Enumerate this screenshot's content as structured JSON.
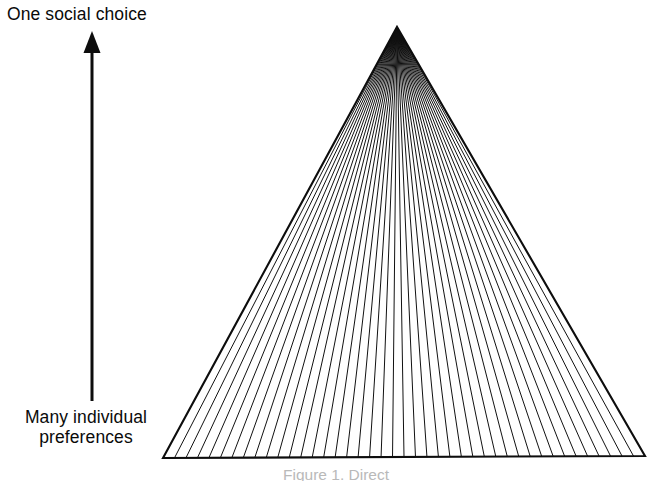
{
  "figure": {
    "background_color": "#ffffff",
    "ink_color": "#000000",
    "top_label": "One social choice",
    "bottom_label_line1": "Many individual",
    "bottom_label_line2": "preferences",
    "caption": "Figure 1.  Direct",
    "arrow": {
      "name": "upward-arrow",
      "direction": "up",
      "x": 92,
      "tail_y": 401,
      "head_y": 31,
      "shaft_width": 3,
      "head_width": 17,
      "head_height": 22
    },
    "triangle": {
      "apex_x": 397,
      "apex_y": 27,
      "base_left_x": 163,
      "base_left_y": 458,
      "base_right_x": 645,
      "base_right_y": 456,
      "outline_width": 2.1,
      "ray_count": 41,
      "ray_width": 1.0
    }
  },
  "chart_data": {
    "type": "diagram",
    "ylabel_top": "One social choice",
    "ylabel_bottom": "Many individual preferences",
    "axis_direction": "bottom-to-top",
    "grid": false,
    "legend": "none",
    "rays": 41,
    "apex": [
      397,
      27
    ],
    "base": [
      [
        163,
        458
      ],
      [
        645,
        456
      ]
    ]
  }
}
